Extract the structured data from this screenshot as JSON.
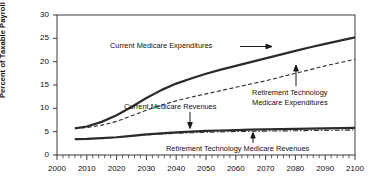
{
  "chart_data": {
    "type": "line",
    "title": "",
    "xlabel": "",
    "ylabel": "Percent of Taxable Payroll",
    "xlim": [
      2000,
      2100
    ],
    "ylim": [
      0,
      30
    ],
    "xticks": [
      2000,
      2010,
      2020,
      2030,
      2040,
      2050,
      2060,
      2070,
      2080,
      2090,
      2100
    ],
    "yticks": [
      0,
      5,
      10,
      15,
      20,
      25,
      30
    ],
    "grid": false,
    "legend_position": "inline-annotations",
    "minor_xtick_interval": 2,
    "x": [
      2006,
      2010,
      2015,
      2020,
      2025,
      2030,
      2035,
      2040,
      2045,
      2050,
      2055,
      2060,
      2065,
      2070,
      2075,
      2080,
      2085,
      2090,
      2095,
      2100
    ],
    "series": [
      {
        "name": "Current Medicare Expenditures",
        "style": "solid",
        "width": 2.2,
        "color": "#2b2b2b",
        "values": [
          5.7,
          6.1,
          7.1,
          8.5,
          10.3,
          12.2,
          13.9,
          15.3,
          16.4,
          17.4,
          18.3,
          19.1,
          19.9,
          20.7,
          21.5,
          22.3,
          23.1,
          23.8,
          24.5,
          25.2
        ]
      },
      {
        "name": "Retirement Technology Medicare Expenditures",
        "style": "dashed",
        "width": 1.1,
        "color": "#2b2b2b",
        "values": [
          5.7,
          5.9,
          6.4,
          7.2,
          8.4,
          9.6,
          10.7,
          11.6,
          12.4,
          13.1,
          13.8,
          14.5,
          15.2,
          15.9,
          16.7,
          17.5,
          18.3,
          19.1,
          19.8,
          20.5
        ]
      },
      {
        "name": "Current Medicare Revenues",
        "style": "solid",
        "width": 2.2,
        "color": "#2b2b2b",
        "values": [
          3.4,
          3.45,
          3.6,
          3.8,
          4.1,
          4.4,
          4.65,
          4.85,
          5.0,
          5.15,
          5.25,
          5.35,
          5.45,
          5.5,
          5.55,
          5.6,
          5.65,
          5.7,
          5.75,
          5.8
        ]
      },
      {
        "name": "Retirement Technology Medicare Revenues",
        "style": "dash-dot",
        "width": 1.1,
        "color": "#2b2b2b",
        "values": [
          3.4,
          3.45,
          3.58,
          3.76,
          4.02,
          4.3,
          4.5,
          4.66,
          4.78,
          4.88,
          4.96,
          5.02,
          5.08,
          5.12,
          5.16,
          5.2,
          5.24,
          5.28,
          5.32,
          5.35
        ]
      }
    ],
    "annotations": [
      {
        "id": "current-medicare-expenditures",
        "text": "Current Medicare Expenditures",
        "lines": [
          "Current Medicare Expenditures"
        ],
        "pointer": "arrow-right"
      },
      {
        "id": "retirement-technology-medicare-expenditures",
        "text": "Retirement Technology Medicare Expenditures",
        "lines": [
          "Retirement Technology",
          "Medicare Expenditures"
        ],
        "pointer": "arrow-up"
      },
      {
        "id": "current-medicare-revenues",
        "text": "Current Medicare Revenues",
        "lines": [
          "Current Medicare Revenues"
        ],
        "pointer": "arrow-down"
      },
      {
        "id": "retirement-technology-medicare-revenues",
        "text": "Retirement Technology Medicare Revenues",
        "lines": [
          "Retirement Technology Medicare Revenues"
        ],
        "pointer": "arrow-up"
      }
    ]
  },
  "axis": {
    "ylabel": "Percent of Taxable Payroll",
    "yticklabels": [
      "30",
      "25",
      "20",
      "15",
      "10",
      "5",
      "0"
    ],
    "xticklabels": [
      "2000",
      "2010",
      "2020",
      "2030",
      "2040",
      "2050",
      "2060",
      "2070",
      "2080",
      "2090",
      "2100"
    ]
  },
  "annotations_text": {
    "a0_l0": "Current Medicare Expenditures",
    "a1_l0": "Retirement Technology",
    "a1_l1": "Medicare Expenditures",
    "a2_l0": "Current Medicare Revenues",
    "a3_l0": "Retirement Technology Medicare Revenues"
  }
}
